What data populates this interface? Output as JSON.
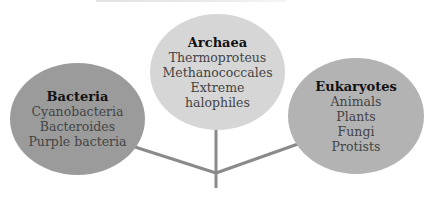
{
  "colors": {
    "bacteria_fill": "#9b9b9b",
    "archaea_fill": "#d6d6d6",
    "eukaryotes_fill": "#b3b3b3",
    "branch_line": "#8a8a8a"
  },
  "nodes": {
    "bacteria": {
      "title": "Bacteria",
      "items": [
        "Cyanobacteria",
        "Bacteroides",
        "Purple bacteria"
      ]
    },
    "archaea": {
      "title": "Archaea",
      "items": [
        "Thermoproteus",
        "Methanococcales",
        "Extreme",
        "halophiles"
      ]
    },
    "eukaryotes": {
      "title": "Eukaryotes",
      "items": [
        "Animals",
        "Plants",
        "Fungi",
        "Protists"
      ]
    }
  }
}
